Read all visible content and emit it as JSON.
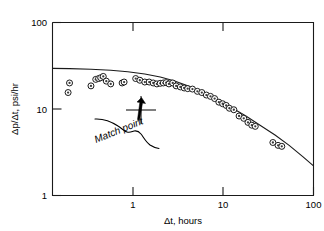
{
  "chart_data": {
    "type": "scatter",
    "title": "",
    "xlabel": "Δt, hours",
    "ylabel": "Δp/Δt, psi/hr",
    "xscale": "log",
    "yscale": "log",
    "xlim": [
      0.2,
      100
    ],
    "ylim": [
      1,
      100
    ],
    "grid": false,
    "legend": null,
    "xticks": [
      1,
      10,
      100
    ],
    "xtick_labels": [
      "1",
      "10",
      "100"
    ],
    "yticks": [
      1,
      10,
      100
    ],
    "ytick_labels": [
      "1",
      "10",
      "100"
    ],
    "series": [
      {
        "name": "Field data",
        "marker": "donut-circle",
        "x": [
          0.29,
          0.3,
          0.5,
          0.56,
          0.6,
          0.63,
          0.67,
          0.72,
          0.8,
          1.05,
          1.1,
          1.45,
          1.6,
          1.8,
          2.0,
          2.2,
          2.4,
          2.6,
          2.8,
          3.0,
          3.2,
          3.5,
          3.8,
          4.2,
          4.6,
          5.0,
          5.6,
          6.3,
          7.0,
          7.8,
          8.6,
          9.5,
          10.5,
          11.5,
          12.5,
          13.5,
          15.0,
          17.0,
          19.0,
          21.0,
          23.0,
          25.0,
          38.0,
          43.0,
          47.0
        ],
        "y": [
          15.5,
          20.0,
          18.5,
          22.0,
          22.5,
          23.0,
          23.8,
          21.0,
          19.5,
          20.0,
          20.5,
          22.5,
          21.5,
          20.5,
          20.5,
          20.0,
          19.5,
          19.8,
          20.0,
          20.2,
          19.5,
          20.0,
          18.5,
          18.0,
          17.5,
          17.2,
          17.0,
          16.0,
          15.5,
          14.5,
          14.0,
          13.2,
          12.0,
          11.5,
          11.0,
          10.2,
          9.8,
          8.3,
          7.8,
          7.0,
          6.5,
          6.3,
          4.1,
          3.8,
          3.7
        ]
      },
      {
        "name": "Type curve",
        "marker": "none",
        "line": true,
        "x": [
          0.2,
          0.3,
          0.5,
          0.8,
          1.2,
          1.8,
          2.6,
          3.6,
          5.0,
          7.0,
          10.0,
          14.0,
          20.0,
          28.0,
          40.0,
          56.0,
          78.0,
          100.0
        ],
        "y": [
          29.5,
          29.3,
          28.8,
          28.0,
          27.0,
          25.4,
          23.4,
          21.2,
          18.6,
          15.9,
          13.0,
          10.5,
          8.3,
          6.5,
          5.0,
          3.8,
          2.8,
          2.2
        ]
      }
    ],
    "annotations": [
      {
        "name": "match-point",
        "label": "Match point",
        "x": 1.0,
        "y": 10.0,
        "marker": "cross",
        "rotation_deg": -22
      }
    ]
  },
  "axes": {
    "x_title": "Δt, hours",
    "y_title": "Δp/Δt, psi/hr",
    "x_tick_labels": [
      "1",
      "10",
      "100"
    ],
    "y_tick_labels": [
      "100",
      "10",
      "1"
    ]
  },
  "annotation": {
    "match_point_label": "Match point"
  },
  "colors": {
    "line": "#1a1a1a",
    "marker_fill": "#ffffff",
    "marker_core": "#3a3a3a",
    "background": "#ffffff",
    "text": "#000000"
  }
}
